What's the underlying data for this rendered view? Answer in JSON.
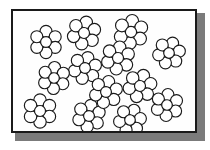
{
  "figure": {
    "type": "illustration",
    "title": "",
    "caption": "",
    "background_color": "#ffffff",
    "frame": {
      "border_color": "#1a1a1a",
      "border_width_px": 2,
      "fill_color": "#ffffff",
      "shadow_color": "#7b7b7b",
      "x": 11,
      "y": 9,
      "width": 186,
      "height": 124
    },
    "cluster_style": {
      "circle_fill": "#ffffff",
      "circle_stroke": "#1a1a1a",
      "stroke_width_px": 1.15,
      "circles_per_cluster": 7,
      "petals_per_cluster": 6,
      "has_center_circle": true
    },
    "cluster_count": 13,
    "clusters": [
      {
        "id": "cluster-1",
        "cx": 46,
        "cy": 42,
        "r_petal": 6.0,
        "r_core": 5.4,
        "ring": 10.6,
        "rotation_deg": 0
      },
      {
        "id": "cluster-2",
        "cx": 84,
        "cy": 33,
        "r_petal": 6.2,
        "r_core": 5.5,
        "ring": 10.9,
        "rotation_deg": 12
      },
      {
        "id": "cluster-3",
        "cx": 131,
        "cy": 32,
        "r_petal": 6.4,
        "r_core": 5.6,
        "ring": 11.2,
        "rotation_deg": 6
      },
      {
        "id": "cluster-4",
        "cx": 169,
        "cy": 53,
        "r_petal": 6.0,
        "r_core": 5.3,
        "ring": 10.5,
        "rotation_deg": 20
      },
      {
        "id": "cluster-5",
        "cx": 118,
        "cy": 58,
        "r_petal": 6.2,
        "r_core": 5.5,
        "ring": 10.9,
        "rotation_deg": 9
      },
      {
        "id": "cluster-6",
        "cx": 85,
        "cy": 68,
        "r_petal": 6.1,
        "r_core": 5.4,
        "ring": 10.7,
        "rotation_deg": 15
      },
      {
        "id": "cluster-7",
        "cx": 54,
        "cy": 78,
        "r_petal": 6.0,
        "r_core": 5.3,
        "ring": 10.5,
        "rotation_deg": 3
      },
      {
        "id": "cluster-8",
        "cx": 140,
        "cy": 86,
        "r_petal": 6.2,
        "r_core": 5.5,
        "ring": 10.9,
        "rotation_deg": 18
      },
      {
        "id": "cluster-9",
        "cx": 40,
        "cy": 111,
        "r_petal": 6.2,
        "r_core": 5.5,
        "ring": 10.9,
        "rotation_deg": 0
      },
      {
        "id": "cluster-10",
        "cx": 89,
        "cy": 116,
        "r_petal": 6.1,
        "r_core": 5.4,
        "ring": 10.7,
        "rotation_deg": 10
      },
      {
        "id": "cluster-11",
        "cx": 130,
        "cy": 120,
        "r_petal": 6.0,
        "r_core": 5.3,
        "ring": 10.5,
        "rotation_deg": 22
      },
      {
        "id": "cluster-12",
        "cx": 167,
        "cy": 105,
        "r_petal": 6.0,
        "r_core": 5.3,
        "ring": 10.5,
        "rotation_deg": 5
      },
      {
        "id": "cluster-13",
        "cx": 106,
        "cy": 92,
        "r_petal": 6.1,
        "r_core": 5.4,
        "ring": 10.7,
        "rotation_deg": 14
      }
    ]
  }
}
